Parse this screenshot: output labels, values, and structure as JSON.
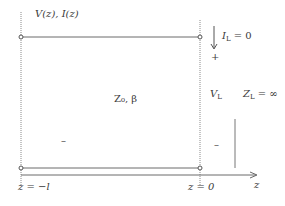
{
  "diagram": {
    "type": "transmission-line-open-circuit",
    "colors": {
      "line": "#6a6a6a",
      "text": "#3a3a3a",
      "background": "#ffffff"
    },
    "labels": {
      "top_left": "V(z), I(z)",
      "line_params": "Z₀, β",
      "load_current": "I",
      "load_current_sub": "L",
      "load_current_value": " = 0",
      "plus": "+",
      "load_voltage": "V",
      "load_voltage_sub": "L",
      "load_impedance": "Z",
      "load_impedance_sub": "L",
      "load_impedance_value": " = ∞",
      "minus_left": "–",
      "minus_right": "–",
      "z_start": "z = −l",
      "z_end": "z = 0",
      "axis": "z"
    }
  }
}
